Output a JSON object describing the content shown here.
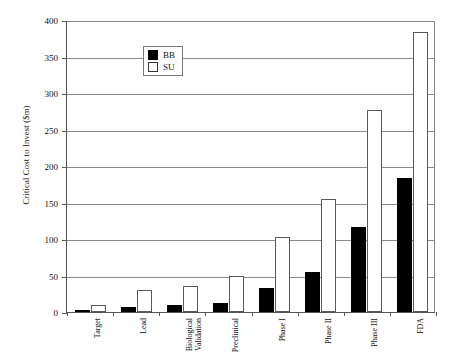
{
  "chart_data": {
    "type": "bar",
    "title": "",
    "xlabel": "",
    "ylabel": "Critical Cost to Invest  ($m)",
    "ylim": [
      0,
      400
    ],
    "ytick_step": 50,
    "yticks": [
      0,
      50,
      100,
      150,
      200,
      250,
      300,
      350,
      400
    ],
    "grid": true,
    "legend_position": "top-left",
    "categories": [
      "Target",
      "Lead",
      "Biological\nValidation",
      "Preclinical",
      "Phase I",
      "Phase II",
      "Phase III",
      "FDA"
    ],
    "series": [
      {
        "name": "BB",
        "color": "#000000",
        "values": [
          3,
          7,
          9,
          13,
          33,
          55,
          117,
          184
        ]
      },
      {
        "name": "SU",
        "color": "#ffffff",
        "values": [
          9,
          30,
          36,
          49,
          103,
          155,
          277,
          383
        ]
      }
    ]
  },
  "legend": {
    "items": [
      {
        "label": "BB"
      },
      {
        "label": "SU"
      }
    ]
  }
}
